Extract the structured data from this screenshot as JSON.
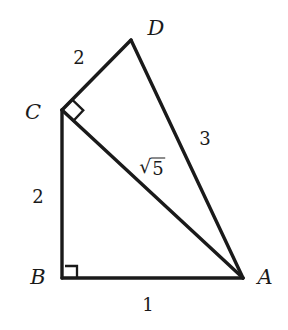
{
  "figure": {
    "background_color": "#ffffff",
    "stroke_color": "#1a1a1a",
    "width": 288,
    "height": 330
  },
  "vertices": [
    {
      "name": "A",
      "label": "A",
      "x": 243,
      "y": 278,
      "label_x": 265,
      "label_y": 277
    },
    {
      "name": "B",
      "label": "B",
      "x": 62,
      "y": 278,
      "label_x": 38,
      "label_y": 277
    },
    {
      "name": "C",
      "label": "C",
      "x": 62,
      "y": 110,
      "label_x": 33,
      "label_y": 112
    },
    {
      "name": "D",
      "label": "D",
      "x": 131,
      "y": 40,
      "label_x": 156,
      "label_y": 28
    }
  ],
  "segments": [
    {
      "name": "segment-BA",
      "from": "B",
      "to": "A"
    },
    {
      "name": "segment-BC",
      "from": "B",
      "to": "C"
    },
    {
      "name": "segment-CD",
      "from": "C",
      "to": "D"
    },
    {
      "name": "segment-DA",
      "from": "D",
      "to": "A"
    },
    {
      "name": "segment-CA",
      "from": "C",
      "to": "A"
    }
  ],
  "side_labels": [
    {
      "name": "length-BA",
      "text": "1",
      "x": 148,
      "y": 305
    },
    {
      "name": "length-BC",
      "text": "2",
      "x": 38,
      "y": 197
    },
    {
      "name": "length-CD",
      "text": "2",
      "x": 79,
      "y": 58
    },
    {
      "name": "length-DA",
      "text": "3",
      "x": 205,
      "y": 139
    }
  ],
  "diagonal_label": {
    "name": "length-CA",
    "radical": "√",
    "radicand": "5",
    "x": 152,
    "y": 167
  },
  "right_angles": [
    {
      "name": "right-angle-B",
      "at": "B",
      "style": "square"
    },
    {
      "name": "right-angle-C",
      "at": "C",
      "style": "diamond"
    }
  ]
}
